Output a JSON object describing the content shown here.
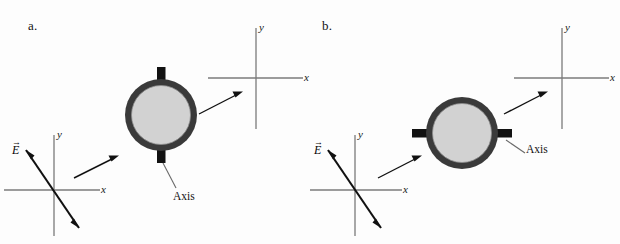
{
  "figure": {
    "width": 620,
    "height": 244,
    "background": "#fdfdfd"
  },
  "colors": {
    "ring_outer": "#3a3a3a",
    "ring_fill": "#d2d2d2",
    "tab": "#121212",
    "axis_line": "#777777",
    "arrow": "#111111",
    "leader_line": "#6a6a6a",
    "text": "#111111"
  },
  "panels": [
    {
      "id": "a",
      "label": "a.",
      "ring": {
        "center_x": 161,
        "center_y": 115,
        "outer_radius": 36,
        "ring_thickness": 6,
        "axis_orientation": "vertical"
      },
      "tabs": [
        {
          "name": "axis-tab-top",
          "position": "top"
        },
        {
          "name": "axis-tab-bottom",
          "position": "bottom"
        }
      ],
      "axis_callout": {
        "label": "Axis",
        "text_x": 173,
        "text_y": 197
      },
      "coord_before": {
        "name": "coordinate-system-before",
        "origin_x": 54,
        "origin_y": 190,
        "x_label": "x",
        "y_label": "y",
        "efield_label": "E",
        "efield_vector_arrow": "→",
        "efield_angle_deg": -62,
        "has_field": true
      },
      "coord_after": {
        "name": "coordinate-system-after",
        "origin_x": 256,
        "origin_y": 78,
        "x_label": "x",
        "y_label": "y",
        "has_field": false
      },
      "connectors": [
        {
          "name": "connector-arrow-before-to-ring",
          "x1": 74,
          "y1": 178,
          "x2": 116,
          "y2": 157
        },
        {
          "name": "connector-arrow-ring-to-after",
          "x1": 196,
          "y1": 113,
          "x2": 240,
          "y2": 92
        }
      ]
    },
    {
      "id": "b",
      "label": "b.",
      "ring": {
        "center_x": 152,
        "center_y": 133,
        "outer_radius": 36,
        "ring_thickness": 6,
        "axis_orientation": "horizontal"
      },
      "tabs": [
        {
          "name": "axis-tab-left",
          "position": "left"
        },
        {
          "name": "axis-tab-right",
          "position": "right"
        }
      ],
      "axis_callout": {
        "label": "Axis",
        "text_x": 216,
        "text_y": 150
      },
      "coord_before": {
        "name": "coordinate-system-before",
        "origin_x": 45,
        "origin_y": 190,
        "x_label": "x",
        "y_label": "y",
        "efield_label": "E",
        "efield_vector_arrow": "→",
        "efield_angle_deg": -62,
        "has_field": true
      },
      "coord_after": {
        "name": "coordinate-system-after",
        "origin_x": 252,
        "origin_y": 78,
        "x_label": "x",
        "y_label": "y",
        "has_field": false
      },
      "connectors": [
        {
          "name": "connector-arrow-before-to-ring",
          "x1": 68,
          "y1": 178,
          "x2": 110,
          "y2": 157
        },
        {
          "name": "connector-arrow-ring-to-after",
          "x1": 188,
          "y1": 113,
          "x2": 233,
          "y2": 92
        }
      ]
    }
  ]
}
